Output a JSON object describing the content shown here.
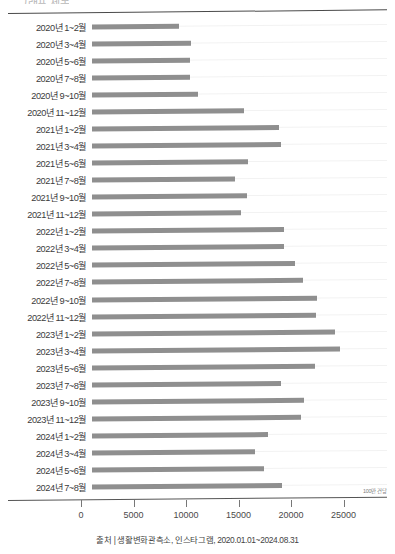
{
  "chart": {
    "title_partial": "그래프 제목",
    "unit_label": "100만 건당",
    "source": "출처 | 생활변화관측소, 인스타그램, 2020.01.01~2024.08.31",
    "bar_color": "#8f8f8f",
    "grid_color": "#f2f2f2",
    "axis_color": "#555555"
  },
  "chart_data": {
    "type": "bar",
    "orientation": "horizontal",
    "title": "",
    "xlabel": "",
    "ylabel": "",
    "unit": "100만 건당",
    "xlim": [
      0,
      27500
    ],
    "grid": true,
    "legend": false,
    "ticks": [
      "0",
      "5000",
      "10000",
      "15000",
      "20000",
      "25000"
    ],
    "tick_values": [
      0,
      5000,
      10000,
      15000,
      20000,
      25000
    ],
    "categories": [
      "2020년 1~2월",
      "2020년 3~4월",
      "2020년 5~6월",
      "2020년 7~8월",
      "2020년 9~10월",
      "2020년 11~12월",
      "2021년 1~2월",
      "2021년 3~4월",
      "2021년 5~6월",
      "2021년 7~8월",
      "2021년 9~10월",
      "2021년 11~12월",
      "2022년 1~2월",
      "2022년 3~4월",
      "2022년 5~6월",
      "2022년 7~8월",
      "2022년 9~10월",
      "2022년 11~12월",
      "2023년 1~2월",
      "2023년 3~4월",
      "2023년 5~6월",
      "2023년 7~8월",
      "2023년 9~10월",
      "2023년 11~12월",
      "2024년 1~2월",
      "2024년 3~4월",
      "2024년 5~6월",
      "2024년 7~8월"
    ],
    "values": [
      8300,
      9400,
      9300,
      9300,
      10100,
      14500,
      17800,
      18000,
      14900,
      13600,
      14800,
      14200,
      18300,
      18300,
      19300,
      20100,
      21400,
      21300,
      23100,
      23600,
      21200,
      18000,
      20200,
      19900,
      16800,
      15500,
      16400,
      18100
    ]
  }
}
